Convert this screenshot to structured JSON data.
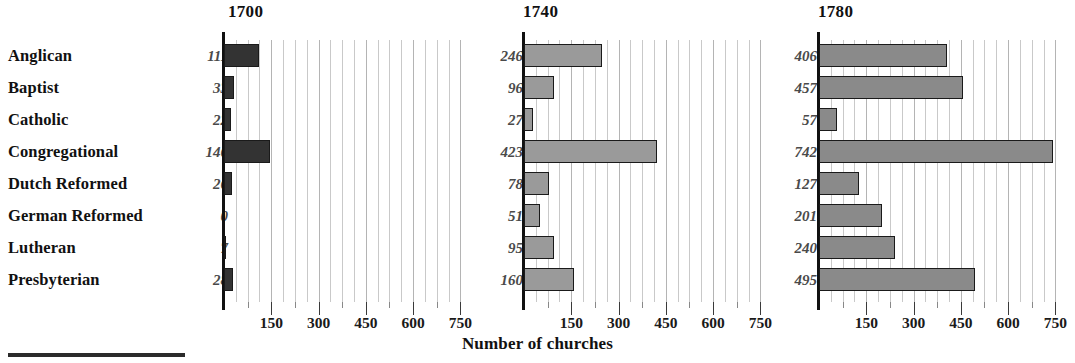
{
  "chart_data": {
    "type": "bar",
    "title": "",
    "xlabel": "Number of churches",
    "ylabel": "",
    "orientation": "horizontal",
    "grid": true,
    "legend": "none",
    "xlim": [
      0,
      787
    ],
    "xticks_major": [
      150,
      300,
      450,
      600,
      750
    ],
    "xticks_minor": [
      75,
      225,
      375,
      525,
      675
    ],
    "gridline_step": 37.5,
    "categories": [
      "Anglican",
      "Baptist",
      "Catholic",
      "Congregational",
      "Dutch Reformed",
      "German Reformed",
      "Lutheran",
      "Presbyterian"
    ],
    "panels": [
      {
        "year": "1700",
        "bar_color": "#333333",
        "values": [
          111,
          33,
          22,
          146,
          26,
          0,
          7,
          28
        ],
        "value_labels": [
          "111",
          "33",
          "22",
          "146",
          "26",
          "0",
          "7",
          "28"
        ]
      },
      {
        "year": "1740",
        "bar_color": "#9a9a9a",
        "values": [
          246,
          96,
          27,
          423,
          78,
          51,
          95,
          160
        ],
        "value_labels": [
          "246",
          "96",
          "27",
          "423",
          "78",
          "51",
          "95",
          "160"
        ]
      },
      {
        "year": "1780",
        "bar_color": "#8a8a8a",
        "values": [
          406,
          457,
          57,
          742,
          127,
          201,
          240,
          495
        ],
        "value_labels": [
          "406",
          "457",
          "57",
          "742",
          "127",
          "201",
          "240",
          "495"
        ]
      }
    ],
    "axis_tick_labels": [
      "150",
      "300",
      "450",
      "600",
      "750"
    ],
    "colors": {
      "axis": "#111111",
      "gridline": "#c9c9c9",
      "bar_outline": "#1a1a1a",
      "value_text": "#4a4a4a",
      "label_text": "#111111"
    }
  },
  "figure": {
    "caption": "Number of churches"
  }
}
